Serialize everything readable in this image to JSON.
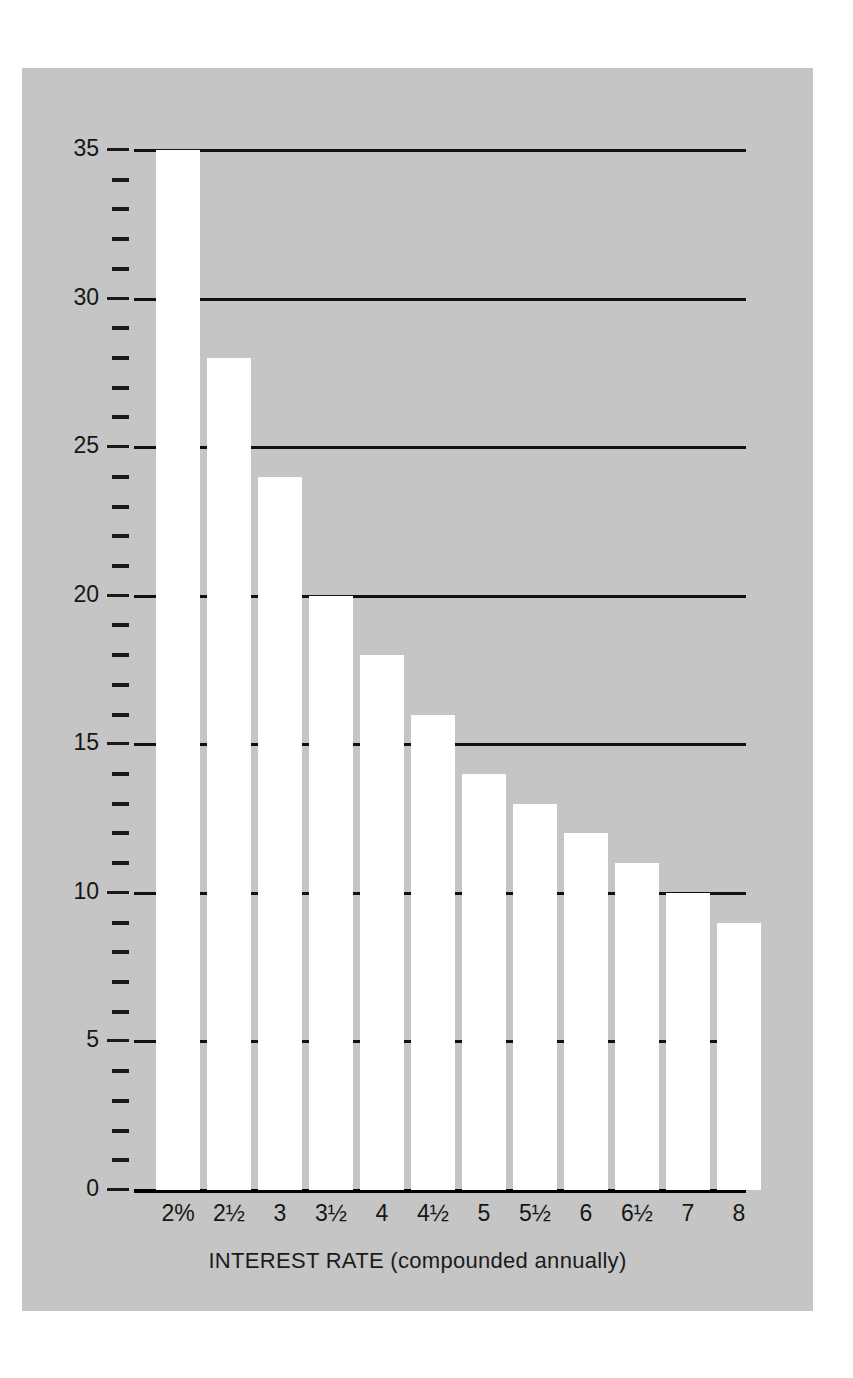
{
  "chart_data": {
    "type": "bar",
    "title": "",
    "xlabel": "INTEREST RATE (compounded annually)",
    "ylabel": "APPROXIMATE NUMBER OF YEARS TO DOUBLE",
    "categories": [
      "2%",
      "2½",
      "3",
      "3½",
      "4",
      "4½",
      "5",
      "5½",
      "6",
      "6½",
      "7",
      "8"
    ],
    "values": [
      35,
      28,
      24,
      20,
      18,
      16,
      14,
      13,
      12,
      11,
      10,
      9
    ],
    "ylim": [
      0,
      35
    ],
    "ytick_labels": [
      "0",
      "5",
      "10",
      "15",
      "20",
      "25",
      "30",
      "35"
    ],
    "ytick_values": [
      0,
      5,
      10,
      15,
      20,
      25,
      30,
      35
    ],
    "minor_tick_interval": 1,
    "grid": "horizontal-major-only",
    "legend": "none",
    "bar_color": "#ffffff",
    "panel_color": "#c5c5c5",
    "line_color": "#111111"
  }
}
